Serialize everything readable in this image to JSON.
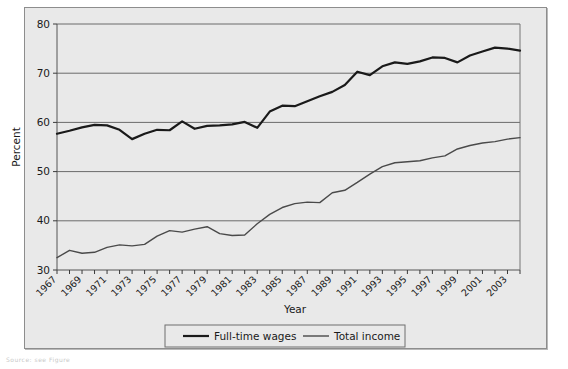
{
  "figure": {
    "background_color": "#e9e9e9",
    "frame_color": "#8d8d8d",
    "caption": "Source: see Figure"
  },
  "legend": {
    "items": [
      {
        "label": "Full-time wages",
        "color": "#1a1a1a",
        "width": 2.2
      },
      {
        "label": "Total income",
        "color": "#4a4a4a",
        "width": 1.4
      }
    ]
  },
  "chart_data": {
    "type": "line",
    "title": "",
    "xlabel": "Year",
    "ylabel": "Percent",
    "xlim": [
      1967,
      2004
    ],
    "ylim": [
      30,
      80
    ],
    "yticks": [
      30,
      40,
      50,
      60,
      70,
      80
    ],
    "ytick_labels": [
      "30",
      "40",
      "50",
      "60",
      "70",
      "80"
    ],
    "grid": "horizontal",
    "legend_position": "below-axes",
    "x": [
      1967,
      1968,
      1969,
      1970,
      1971,
      1972,
      1973,
      1974,
      1975,
      1976,
      1977,
      1978,
      1979,
      1980,
      1981,
      1982,
      1983,
      1984,
      1985,
      1986,
      1987,
      1988,
      1989,
      1990,
      1991,
      1992,
      1993,
      1994,
      1995,
      1996,
      1997,
      1998,
      1999,
      2000,
      2001,
      2002,
      2003,
      2004
    ],
    "xtick_labels": [
      "1967",
      "1969",
      "1971",
      "1973",
      "1975",
      "1977",
      "1979",
      "1981",
      "1983",
      "1985",
      "1987",
      "1989",
      "1991",
      "1993",
      "1995",
      "1997",
      "1999",
      "2001",
      "2003"
    ],
    "xtick_values": [
      1967,
      1969,
      1971,
      1973,
      1975,
      1977,
      1979,
      1981,
      1983,
      1985,
      1987,
      1989,
      1991,
      1993,
      1995,
      1997,
      1999,
      2001,
      2003
    ],
    "series": [
      {
        "name": "Full-time wages",
        "color": "#1a1a1a",
        "values": [
          57.7,
          58.3,
          59.0,
          59.5,
          59.4,
          58.5,
          56.6,
          57.7,
          58.5,
          58.4,
          60.2,
          58.7,
          59.3,
          59.4,
          59.6,
          60.1,
          58.9,
          62.2,
          63.4,
          63.3,
          64.3,
          65.3,
          66.2,
          67.6,
          70.3,
          69.6,
          71.4,
          72.2,
          71.9,
          72.4,
          73.2,
          73.1,
          72.2,
          73.6,
          74.4,
          75.2,
          75.0,
          74.6
        ]
      },
      {
        "name": "Total income",
        "color": "#4a4a4a",
        "values": [
          32.5,
          34.0,
          33.4,
          33.6,
          34.6,
          35.1,
          34.9,
          35.2,
          36.9,
          38.0,
          37.7,
          38.3,
          38.8,
          37.4,
          37.0,
          37.1,
          39.4,
          41.3,
          42.7,
          43.5,
          43.8,
          43.7,
          45.7,
          46.2,
          47.8,
          49.5,
          51.0,
          51.8,
          52.0,
          52.2,
          52.8,
          53.2,
          54.6,
          55.3,
          55.8,
          56.1,
          56.6,
          56.9
        ]
      }
    ]
  }
}
